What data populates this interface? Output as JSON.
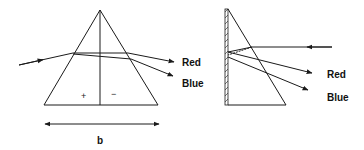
{
  "left_figure": {
    "title": "Prism dispersion (two half-prisms)",
    "ray_labels": {
      "red": "Red",
      "blue": "Blue"
    },
    "region_signs": {
      "left": "+",
      "right": "−"
    },
    "base_dimension_label": "b"
  },
  "right_figure": {
    "title": "Half-prism with mirror backing (reflection dispersion)",
    "ray_labels": {
      "red": "Red",
      "blue": "Blue"
    }
  },
  "colors": {
    "stroke": "#1a1a1a",
    "text": "#111111",
    "background": "#ffffff"
  }
}
